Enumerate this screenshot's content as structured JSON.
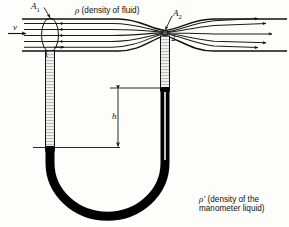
{
  "figure": {
    "labels": {
      "inlet_area": "A",
      "inlet_area_sub": "1",
      "throat_area": "A",
      "throat_area_sub": "2",
      "velocity": "v",
      "station_one": "1",
      "station_two": "2",
      "height": "h",
      "fluid_density_symbol": "ρ",
      "fluid_density_text": " (density of fluid)",
      "manometer_density_symbol": "ρ′",
      "manometer_density_line1": " (density of the",
      "manometer_density_line2": "manometer liquid)"
    },
    "colors": {
      "ink": "#111111",
      "liquid": "#000000",
      "tube_hatch": "#8a8a8a",
      "background": "#fdfdfb",
      "streamline": "#1a1a1a"
    },
    "geometry": {
      "streamline_count": 5,
      "throat_x": 165,
      "left_tube_x": 45,
      "right_tube_x": 160,
      "left_liquid_top_y": 148,
      "right_liquid_top_y": 88,
      "h_marker_x": 118
    }
  }
}
